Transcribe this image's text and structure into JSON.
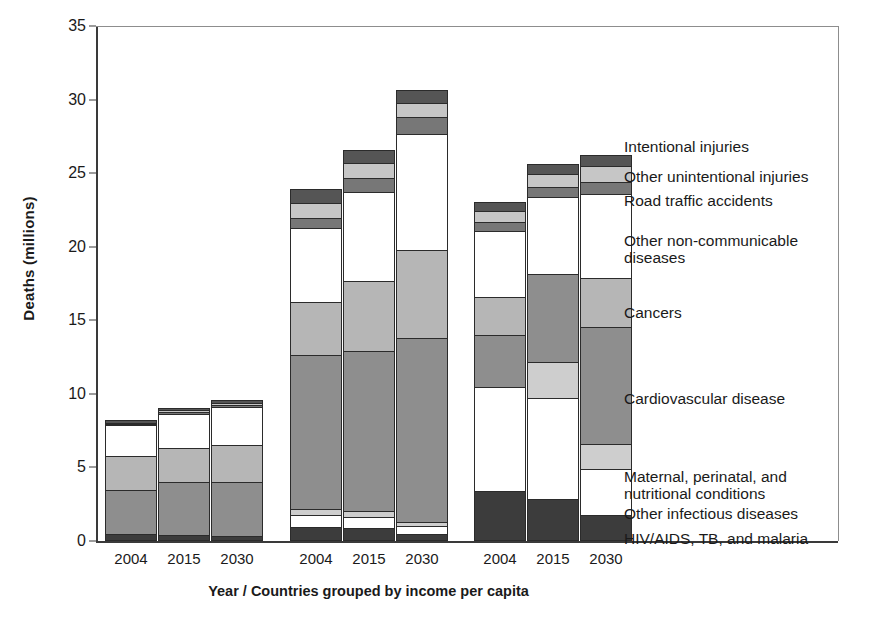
{
  "chart_data": {
    "type": "bar",
    "stacked": true,
    "title": "",
    "xlabel": "Year / Countries grouped by income per capita",
    "ylabel": "Deaths (millions)",
    "ylim": [
      0,
      35
    ],
    "yticks": [
      0,
      5,
      10,
      15,
      20,
      25,
      30,
      35
    ],
    "grid": false,
    "legend_position": "right",
    "group_labels": [
      "Low income",
      "Lower-middle income",
      "High income"
    ],
    "categories": [
      "2004",
      "2015",
      "2030",
      "2004",
      "2015",
      "2030",
      "2004",
      "2015",
      "2030"
    ],
    "series": [
      {
        "name": "HIV/AIDS, TB, and malaria",
        "color": "#3c3c3c",
        "values": [
          0.45,
          0.4,
          0.35,
          0.95,
          0.85,
          0.5,
          3.4,
          2.85,
          1.8
        ]
      },
      {
        "name": "Other infectious  diseases",
        "color": "#ffffff",
        "values": [
          0.0,
          0.0,
          0.0,
          0.85,
          0.8,
          0.55,
          7.1,
          6.9,
          3.1
        ]
      },
      {
        "name": "Maternal, perinatal, and\nnutritional conditions",
        "color": "#cecece",
        "values": [
          0.0,
          0.0,
          0.0,
          0.35,
          0.4,
          0.25,
          0.0,
          2.4,
          1.7
        ]
      },
      {
        "name": "Cardiovascular disease",
        "color": "#8e8e8e",
        "values": [
          3.0,
          3.6,
          3.65,
          10.5,
          10.85,
          12.5,
          3.5,
          6.0,
          7.95
        ]
      },
      {
        "name": "Cancers",
        "color": "#b6b6b6",
        "values": [
          2.3,
          2.3,
          2.5,
          3.6,
          4.75,
          6.0,
          2.6,
          0.0,
          3.3
        ]
      },
      {
        "name": "Other non-communicable\n    diseases",
        "color": "#ffffff",
        "values": [
          2.1,
          2.35,
          2.6,
          5.0,
          6.1,
          7.85,
          4.5,
          5.2,
          5.75
        ]
      },
      {
        "name": "Road traffic accidents",
        "color": "#777777",
        "values": [
          0.1,
          0.12,
          0.14,
          0.7,
          0.95,
          1.15,
          0.55,
          0.7,
          0.8
        ]
      },
      {
        "name": "Other unintentional injuries",
        "color": "#c6c6c6",
        "values": [
          0.1,
          0.12,
          0.14,
          1.0,
          1.0,
          0.95,
          0.75,
          0.9,
          1.1
        ]
      },
      {
        "name": "Intentional injuries",
        "color": "#555555",
        "values": [
          0.15,
          0.16,
          0.17,
          0.95,
          0.9,
          0.9,
          0.65,
          0.7,
          0.75
        ]
      }
    ],
    "totals": [
      8.2,
      9.05,
      9.55,
      23.9,
      26.6,
      30.65,
      23.05,
      25.65,
      26.25
    ]
  },
  "axis": {
    "ylabel": "Deaths (millions)",
    "xlabel": "Year / Countries grouped by income per capita",
    "yticks": [
      "0",
      "5",
      "10",
      "15",
      "20",
      "25",
      "30",
      "35"
    ],
    "xticks": [
      "2004",
      "2015",
      "2030",
      "2004",
      "2015",
      "2030",
      "2004",
      "2015",
      "2030"
    ]
  },
  "legend": {
    "entries": [
      "Intentional injuries",
      "Other unintentional injuries",
      "Road traffic accidents",
      "Other non-communicable\n    diseases",
      "Cancers",
      "Cardiovascular disease",
      "Maternal, perinatal, and\n    nutritional conditions",
      "Other infectious  diseases",
      "HIV/AIDS, TB, and malaria"
    ]
  }
}
